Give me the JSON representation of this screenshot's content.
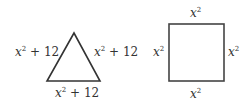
{
  "triangle": {
    "left_label": {
      "var": "x",
      "exp": "2",
      "rest": " + 12"
    },
    "right_label": {
      "var": "x",
      "exp": "2",
      "rest": " + 12"
    },
    "bottom_label": {
      "var": "x",
      "exp": "2",
      "rest": " + 12"
    }
  },
  "square": {
    "top_label": {
      "var": "x",
      "exp": "2",
      "rest": ""
    },
    "left_label": {
      "var": "x",
      "exp": "2",
      "rest": ""
    },
    "right_label": {
      "var": "x",
      "exp": "2",
      "rest": ""
    },
    "bottom_label": {
      "var": "x",
      "exp": "2",
      "rest": ""
    }
  },
  "colors": {
    "stroke": "#333333",
    "text": "#333333"
  }
}
